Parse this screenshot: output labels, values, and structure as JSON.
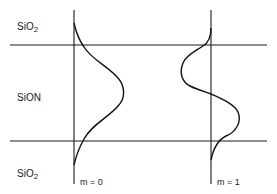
{
  "diagram": {
    "layers": [
      {
        "id": "top-cladding",
        "label": "SiO",
        "subscript": "2"
      },
      {
        "id": "core",
        "label": "SiON",
        "subscript": ""
      },
      {
        "id": "bottom-cladding",
        "label": "SiO",
        "subscript": "2"
      }
    ],
    "modes": [
      {
        "id": "m0",
        "label": "m = 0"
      },
      {
        "id": "m1",
        "label": "m = 1"
      }
    ],
    "colors": {
      "line": "#1a1a1a",
      "background": "#ffffff"
    }
  }
}
